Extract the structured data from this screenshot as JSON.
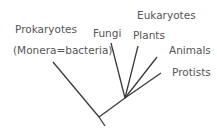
{
  "title": "Eukaryotes",
  "labels": {
    "prokaryotes": "Prokaryotes",
    "monera": "(Monera=bacteria)",
    "fungi": "Fungi",
    "plants": "Plants",
    "eukaryotes": "Eukaryotes",
    "animals": "Animals",
    "protists": "Protists"
  },
  "colors": {
    "line": "#3a3a3a",
    "text": "#555555"
  }
}
